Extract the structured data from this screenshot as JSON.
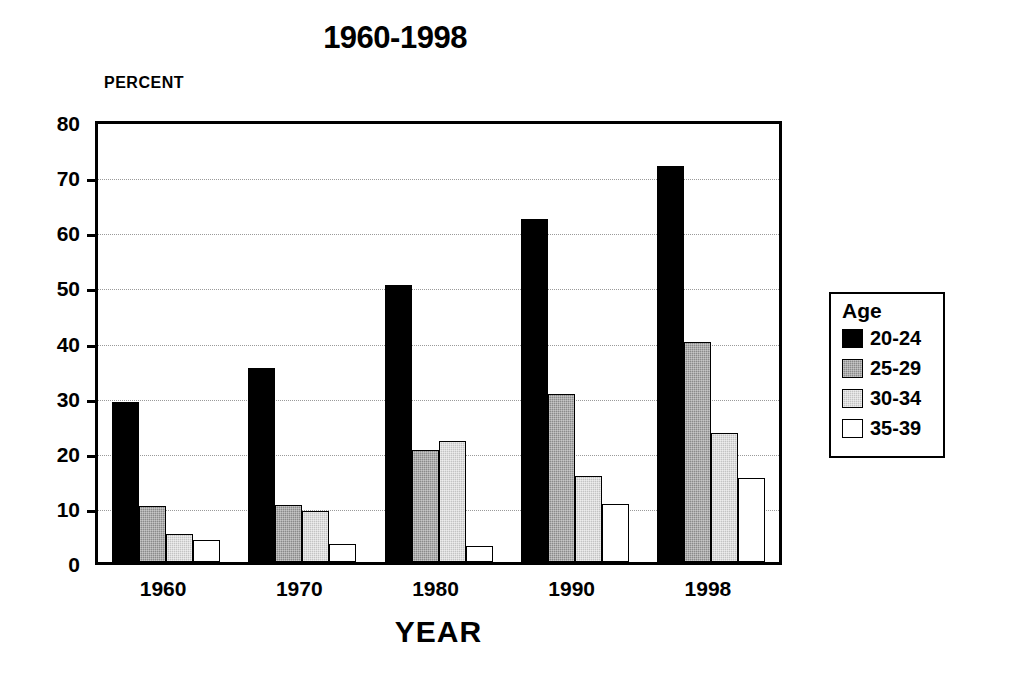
{
  "chart_data": {
    "type": "bar",
    "title": "1960-1998",
    "xlabel": "YEAR",
    "ylabel": "PERCENT",
    "categories": [
      "1960",
      "1970",
      "1980",
      "1990",
      "1998"
    ],
    "series": [
      {
        "name": "20-24",
        "color": "#000000",
        "values": [
          29.0,
          35.2,
          50.2,
          62.2,
          71.8
        ]
      },
      {
        "name": "25-29",
        "color": "#8a8a8a",
        "values": [
          10.2,
          10.3,
          20.4,
          30.5,
          39.9
        ]
      },
      {
        "name": "30-34",
        "color": "#c3c3c3",
        "values": [
          5.1,
          9.2,
          21.9,
          15.6,
          23.4
        ]
      },
      {
        "name": "35-39",
        "color": "#ffffff",
        "values": [
          4.0,
          3.2,
          2.9,
          10.5,
          15.3
        ]
      }
    ],
    "ylim": [
      0,
      80
    ],
    "yticks": [
      0,
      10,
      20,
      30,
      40,
      50,
      60,
      70,
      80
    ],
    "ytick_labels": [
      "0",
      "10",
      "20",
      "30",
      "40",
      "50",
      "60",
      "70",
      "80"
    ],
    "grid": true,
    "legend_position": "right",
    "legend_title": "Age"
  },
  "legend": {
    "title": "Age",
    "entries": [
      {
        "label": "20-24"
      },
      {
        "label": "25-29"
      },
      {
        "label": "30-34"
      },
      {
        "label": "35-39"
      }
    ]
  },
  "axes": {
    "y_caption": "PERCENT",
    "x_caption": "YEAR"
  }
}
